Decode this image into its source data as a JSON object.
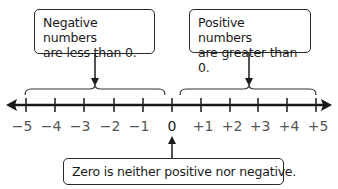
{
  "callouts": {
    "negative": {
      "line1": "Negative numbers",
      "line2": "are less than 0."
    },
    "positive": {
      "line1": "Positive numbers",
      "line2": "are greater than 0."
    },
    "zero": {
      "text": "Zero is neither positive nor negative."
    }
  },
  "number_line": {
    "min": -5,
    "max": 5,
    "tick_labels": [
      "−5",
      "−4",
      "−3",
      "−2",
      "−1",
      "0",
      "+1",
      "+2",
      "+3",
      "+4",
      "+5"
    ],
    "arrows": [
      "left",
      "right"
    ]
  },
  "colors": {
    "line": "#1a1a1a",
    "label": "#555555",
    "zero_label": "#1a1a1a"
  }
}
